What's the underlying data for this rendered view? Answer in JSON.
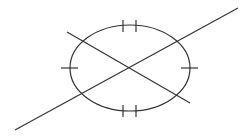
{
  "diagram": {
    "stroke_color": "#333333",
    "background": "#ffffff",
    "center": [
      130,
      68
    ],
    "ellipse": {
      "rx": 60,
      "ry": 43
    },
    "lines": [
      {
        "name": "long-line",
        "x1": 15,
        "y1": 130,
        "x2": 238,
        "y2": 8
      },
      {
        "name": "short-line",
        "x1": 67,
        "y1": 32,
        "x2": 190,
        "y2": 103
      }
    ],
    "tick_marks": {
      "left_arc": 1,
      "right_arc": 1,
      "top_arc": 2,
      "bottom_arc": 2
    }
  }
}
